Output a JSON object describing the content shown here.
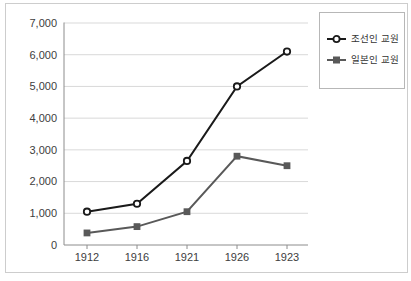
{
  "figure": {
    "background": "#ffffff",
    "border_color": "#cdcdcd"
  },
  "chart_data": {
    "type": "line",
    "title": "",
    "xlabel": "",
    "ylabel": "",
    "categories": [
      "1912",
      "1916",
      "1921",
      "1926",
      "1923"
    ],
    "series": [
      {
        "name": "조선인 교원",
        "values": [
          1050,
          1300,
          2650,
          5000,
          6100
        ],
        "color": "#1a1a1a",
        "marker": "circle-open"
      },
      {
        "name": "일본인 교원",
        "values": [
          380,
          580,
          1050,
          2800,
          2500
        ],
        "color": "#595959",
        "marker": "square-filled"
      }
    ],
    "ylim": [
      0,
      7000
    ],
    "y_tick_step": 1000,
    "y_tick_labels": [
      "0",
      "1,000",
      "2,000",
      "3,000",
      "4,000",
      "5,000",
      "6,000",
      "7,000"
    ],
    "grid": true,
    "grid_color": "#d9d9d9",
    "axis_color": "#8c8c8c",
    "label_color": "#404040",
    "legend_position": "top-right"
  }
}
